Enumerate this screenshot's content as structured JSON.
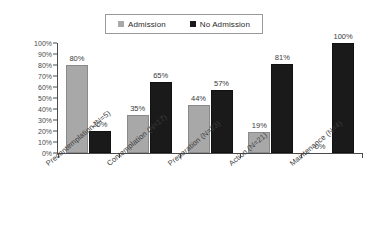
{
  "chart_data": {
    "type": "bar",
    "title": "",
    "subtitle": "",
    "xlabel": "",
    "ylabel": "",
    "ylim": [
      0,
      100
    ],
    "grid": false,
    "legend_position": "top-center",
    "y_ticks": [
      "0%",
      "10%",
      "20%",
      "30%",
      "40%",
      "50%",
      "60%",
      "70%",
      "80%",
      "90%",
      "100%"
    ],
    "y_tick_values": [
      0,
      10,
      20,
      30,
      40,
      50,
      60,
      70,
      80,
      90,
      100
    ],
    "categories": [
      "Precontemplation (N=5)",
      "Contemplation (N=17)",
      "Preparation (N=23)",
      "Action (N=21)",
      "Maintenance (N=4)"
    ],
    "series": [
      {
        "name": "Admission",
        "color": "#a8a8a8",
        "values": [
          80,
          35,
          44,
          19,
          0
        ],
        "labels": [
          "80%",
          "35%",
          "44%",
          "19%",
          "0%"
        ]
      },
      {
        "name": "No Admission",
        "color": "#1a1a1a",
        "values": [
          20,
          65,
          57,
          81,
          100
        ],
        "labels": [
          "20%",
          "65%",
          "57%",
          "81%",
          "100%"
        ]
      }
    ]
  },
  "legend": {
    "entries": [
      {
        "label": "Admission",
        "color": "#a8a8a8"
      },
      {
        "label": "No Admission",
        "color": "#1a1a1a"
      }
    ]
  },
  "colors": {
    "background": "#ffffff",
    "axis": "#4a4a4a",
    "text": "#3a3a3a",
    "admission": "#a8a8a8",
    "no_admission": "#1a1a1a"
  }
}
